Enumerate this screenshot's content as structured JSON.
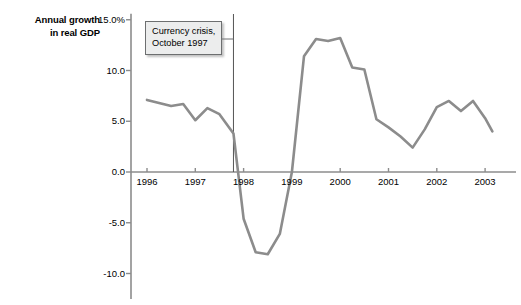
{
  "chart_data": {
    "type": "line",
    "title": "Annual growth in real GDP",
    "title_line1": "Annual growth",
    "title_line2": "in real GDP",
    "xlabel": "",
    "ylabel": "Annual growth in real GDP",
    "xlim": [
      1995.83,
      2003.25
    ],
    "ylim": [
      -12.5,
      15.0
    ],
    "grid": false,
    "legend": null,
    "line_color": "#8c8c8c",
    "axis_color": "#8c8c8c",
    "text_color": "#000000",
    "y_ticks": [
      15.0,
      10.0,
      5.0,
      0.0,
      -5.0,
      -10.0
    ],
    "y_tick_labels": [
      "15.0%",
      "10.0",
      "5.0",
      "0.0",
      "-5.0",
      "-10.0"
    ],
    "x_ticks": [
      1996,
      1997,
      1998,
      1999,
      2000,
      2001,
      2002,
      2003
    ],
    "x_tick_labels": [
      "1996",
      "1997",
      "1998",
      "1999",
      "2000",
      "2001",
      "2002",
      "2003"
    ],
    "annotations": [
      {
        "text_line1": "Currency crisis,",
        "text_line2": "October 1997",
        "x_value": 1997.79,
        "marker": "vertical-line"
      }
    ],
    "series": [
      {
        "name": "Annual growth in real GDP",
        "x": [
          1996.0,
          1996.25,
          1996.5,
          1996.75,
          1997.0,
          1997.25,
          1997.5,
          1997.79,
          1998.0,
          1998.25,
          1998.5,
          1998.75,
          1999.0,
          1999.25,
          1999.5,
          1999.75,
          2000.0,
          2000.25,
          2000.5,
          2000.75,
          2001.0,
          2001.25,
          2001.5,
          2001.75,
          2002.0,
          2002.25,
          2002.5,
          2002.75,
          2003.0,
          2003.15
        ],
        "values": [
          7.1,
          6.8,
          6.5,
          6.7,
          5.1,
          6.3,
          5.7,
          3.8,
          -4.6,
          -7.9,
          -8.1,
          -6.1,
          0.0,
          11.4,
          13.1,
          12.9,
          13.2,
          10.3,
          10.1,
          5.2,
          4.4,
          3.5,
          2.4,
          4.2,
          6.4,
          7.0,
          6.0,
          7.0,
          5.3,
          4.0
        ]
      }
    ]
  }
}
